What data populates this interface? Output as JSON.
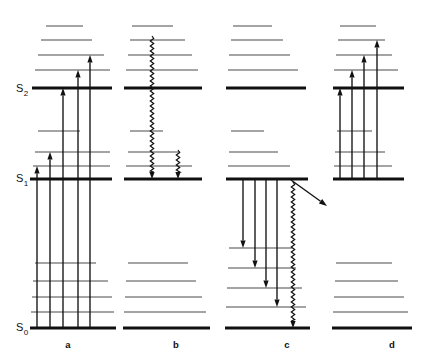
{
  "figure": {
    "type": "jablonski-energy-level-diagram",
    "width": 429,
    "height": 363,
    "background_color": "#ffffff",
    "line_color": "#4a4a4a",
    "bold_line_color": "#101010",
    "arrow_color": "#111111"
  },
  "state_labels": [
    {
      "id": "s2",
      "base": "S",
      "sub": "2",
      "x": 16,
      "y": 92
    },
    {
      "id": "s1",
      "base": "S",
      "sub": "1",
      "x": 16,
      "y": 182
    },
    {
      "id": "s0",
      "base": "S",
      "sub": "0",
      "x": 16,
      "y": 331
    }
  ],
  "panels": [
    {
      "id": "a",
      "label": "a",
      "label_x": 68,
      "label_y": 348,
      "caption": "Absorption transitions from S0 vibrational levels up to S1 and S2 manifolds",
      "levels": [
        {
          "y": 26,
          "x1": 46,
          "x2": 83,
          "weight": "thin"
        },
        {
          "y": 40,
          "x1": 41,
          "x2": 92,
          "weight": "thin"
        },
        {
          "y": 55,
          "x1": 38,
          "x2": 104,
          "weight": "thin"
        },
        {
          "y": 70,
          "x1": 35,
          "x2": 110,
          "weight": "thin"
        },
        {
          "y": 88,
          "x1": 32,
          "x2": 112,
          "weight": "thick"
        },
        {
          "y": 131,
          "x1": 38,
          "x2": 80,
          "weight": "thin"
        },
        {
          "y": 152,
          "x1": 35,
          "x2": 110,
          "weight": "thin"
        },
        {
          "y": 166,
          "x1": 33,
          "x2": 110,
          "weight": "thin"
        },
        {
          "y": 179,
          "x1": 30,
          "x2": 112,
          "weight": "thick"
        },
        {
          "y": 263,
          "x1": 35,
          "x2": 96,
          "weight": "thin"
        },
        {
          "y": 281,
          "x1": 33,
          "x2": 108,
          "weight": "thin"
        },
        {
          "y": 297,
          "x1": 32,
          "x2": 112,
          "weight": "thin"
        },
        {
          "y": 312,
          "x1": 31,
          "x2": 114,
          "weight": "thin"
        },
        {
          "y": 328,
          "x1": 30,
          "x2": 116,
          "weight": "thick"
        }
      ],
      "arrows": [
        {
          "name": "absorption-s0-to-s1-a1",
          "x": 37,
          "y_from": 328,
          "y_to": 166,
          "direction": "up"
        },
        {
          "name": "absorption-s0-to-s1-a2",
          "x": 50,
          "y_from": 328,
          "y_to": 152,
          "direction": "up"
        },
        {
          "name": "absorption-s0-to-s2-a3",
          "x": 63,
          "y_from": 328,
          "y_to": 88,
          "direction": "up"
        },
        {
          "name": "absorption-s0-to-s2-a4",
          "x": 78,
          "y_from": 328,
          "y_to": 70,
          "direction": "up"
        },
        {
          "name": "absorption-s0-to-s2-a5",
          "x": 90,
          "y_from": 328,
          "y_to": 55,
          "direction": "up"
        }
      ]
    },
    {
      "id": "b",
      "label": "b",
      "label_x": 176,
      "label_y": 348,
      "caption": "Internal conversion and vibrational relaxation shown as wavy non-radiative transitions",
      "levels": [
        {
          "y": 26,
          "x1": 132,
          "x2": 173,
          "weight": "thin"
        },
        {
          "y": 40,
          "x1": 130,
          "x2": 185,
          "weight": "thin"
        },
        {
          "y": 55,
          "x1": 128,
          "x2": 192,
          "weight": "thin"
        },
        {
          "y": 70,
          "x1": 126,
          "x2": 198,
          "weight": "thin"
        },
        {
          "y": 88,
          "x1": 124,
          "x2": 202,
          "weight": "thick"
        },
        {
          "y": 131,
          "x1": 130,
          "x2": 163,
          "weight": "thin"
        },
        {
          "y": 152,
          "x1": 128,
          "x2": 180,
          "weight": "thin"
        },
        {
          "y": 166,
          "x1": 126,
          "x2": 192,
          "weight": "thin"
        },
        {
          "y": 179,
          "x1": 124,
          "x2": 202,
          "weight": "thick"
        },
        {
          "y": 263,
          "x1": 128,
          "x2": 188,
          "weight": "thin"
        },
        {
          "y": 281,
          "x1": 126,
          "x2": 196,
          "weight": "thin"
        },
        {
          "y": 297,
          "x1": 125,
          "x2": 202,
          "weight": "thin"
        },
        {
          "y": 312,
          "x1": 124,
          "x2": 206,
          "weight": "thin"
        },
        {
          "y": 328,
          "x1": 123,
          "x2": 210,
          "weight": "thick"
        }
      ],
      "wavy_arrows": [
        {
          "name": "internal-conversion-wavy-long",
          "x": 152,
          "y_from": 36,
          "y_to": 179,
          "direction": "down"
        },
        {
          "name": "vibrational-relaxation-wavy-short",
          "x": 178,
          "y_from": 150,
          "y_to": 179,
          "direction": "down"
        }
      ],
      "arrows": []
    },
    {
      "id": "c",
      "label": "c",
      "label_x": 287,
      "label_y": 348,
      "caption": "Fluorescence emission from S1 down to S0 vibrational levels with intersystem crossing",
      "levels": [
        {
          "y": 26,
          "x1": 233,
          "x2": 272,
          "weight": "thin"
        },
        {
          "y": 40,
          "x1": 231,
          "x2": 283,
          "weight": "thin"
        },
        {
          "y": 55,
          "x1": 229,
          "x2": 290,
          "weight": "thin"
        },
        {
          "y": 70,
          "x1": 228,
          "x2": 298,
          "weight": "thin"
        },
        {
          "y": 88,
          "x1": 226,
          "x2": 306,
          "weight": "thick"
        },
        {
          "y": 131,
          "x1": 231,
          "x2": 264,
          "weight": "thin"
        },
        {
          "y": 152,
          "x1": 229,
          "x2": 278,
          "weight": "thin"
        },
        {
          "y": 166,
          "x1": 228,
          "x2": 290,
          "weight": "thin"
        },
        {
          "y": 179,
          "x1": 226,
          "x2": 308,
          "weight": "thick"
        },
        {
          "y": 248,
          "x1": 229,
          "x2": 292,
          "weight": "thin"
        },
        {
          "y": 268,
          "x1": 228,
          "x2": 296,
          "weight": "thin"
        },
        {
          "y": 288,
          "x1": 227,
          "x2": 302,
          "weight": "thin"
        },
        {
          "y": 307,
          "x1": 226,
          "x2": 306,
          "weight": "thin"
        },
        {
          "y": 328,
          "x1": 225,
          "x2": 310,
          "weight": "thick"
        }
      ],
      "arrows": [
        {
          "name": "fluorescence-s1-to-s0-c1",
          "x": 243,
          "y_from": 179,
          "y_to": 248,
          "direction": "down"
        },
        {
          "name": "fluorescence-s1-to-s0-c2",
          "x": 255,
          "y_from": 179,
          "y_to": 268,
          "direction": "down"
        },
        {
          "name": "fluorescence-s1-to-s0-c3",
          "x": 266,
          "y_from": 179,
          "y_to": 288,
          "direction": "down"
        },
        {
          "name": "fluorescence-s1-to-s0-c4",
          "x": 277,
          "y_from": 179,
          "y_to": 307,
          "direction": "down"
        }
      ],
      "wavy_arrows": [
        {
          "name": "intersystem-crossing-wavy",
          "x": 293,
          "y_from": 182,
          "y_to": 328,
          "direction": "down"
        }
      ],
      "diagonal_arrow": {
        "name": "quenching-diagonal-arrow",
        "x_from": 291,
        "y_from": 180,
        "x_to": 327,
        "y_to": 206
      }
    },
    {
      "id": "d",
      "label": "d",
      "label_x": 392,
      "label_y": 348,
      "caption": "Excited state absorption from S1 to higher levels above S2",
      "levels": [
        {
          "y": 26,
          "x1": 340,
          "x2": 376,
          "weight": "thin"
        },
        {
          "y": 40,
          "x1": 338,
          "x2": 385,
          "weight": "thin"
        },
        {
          "y": 55,
          "x1": 336,
          "x2": 392,
          "weight": "thin"
        },
        {
          "y": 70,
          "x1": 334,
          "x2": 398,
          "weight": "thin"
        },
        {
          "y": 88,
          "x1": 333,
          "x2": 404,
          "weight": "thick"
        },
        {
          "y": 131,
          "x1": 337,
          "x2": 372,
          "weight": "thin"
        },
        {
          "y": 152,
          "x1": 335,
          "x2": 385,
          "weight": "thin"
        },
        {
          "y": 166,
          "x1": 334,
          "x2": 392,
          "weight": "thin"
        },
        {
          "y": 179,
          "x1": 333,
          "x2": 404,
          "weight": "thick"
        },
        {
          "y": 263,
          "x1": 336,
          "x2": 392,
          "weight": "thin"
        },
        {
          "y": 281,
          "x1": 335,
          "x2": 398,
          "weight": "thin"
        },
        {
          "y": 297,
          "x1": 334,
          "x2": 404,
          "weight": "thin"
        },
        {
          "y": 312,
          "x1": 333,
          "x2": 408,
          "weight": "thin"
        },
        {
          "y": 328,
          "x1": 332,
          "x2": 412,
          "weight": "thick"
        }
      ],
      "arrows": [
        {
          "name": "excited-absorption-d1",
          "x": 340,
          "y_from": 179,
          "y_to": 88,
          "direction": "up"
        },
        {
          "name": "excited-absorption-d2",
          "x": 352,
          "y_from": 179,
          "y_to": 70,
          "direction": "up"
        },
        {
          "name": "excited-absorption-d3",
          "x": 364,
          "y_from": 179,
          "y_to": 55,
          "direction": "up"
        },
        {
          "name": "excited-absorption-d4",
          "x": 377,
          "y_from": 179,
          "y_to": 40,
          "direction": "up"
        }
      ]
    }
  ]
}
